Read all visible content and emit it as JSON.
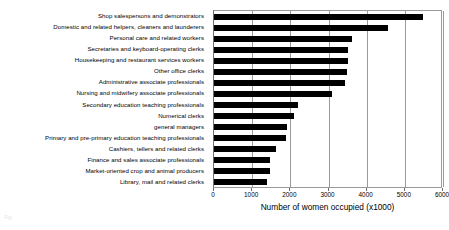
{
  "chart_data": {
    "type": "bar",
    "orientation": "horizontal",
    "title": "",
    "xlabel": "Number of women occupied (x1000)",
    "ylabel": "",
    "xlim": [
      0,
      6000
    ],
    "xticks": [
      0,
      1000,
      2000,
      3000,
      4000,
      5000,
      6000
    ],
    "xtick_labels": [
      "0",
      "1000",
      "2000",
      "3000",
      "4000",
      "5000",
      "6000"
    ],
    "grid": "vertical",
    "legend": "none",
    "bar_color": "#000000",
    "grid_color": "#9a9a9a",
    "categories": [
      "Shop salespersons and demonstrators",
      "Domestic and related helpers, cleaners and launderers",
      "Personal care and related workers",
      "Secretaries and keyboard-operating clerks",
      "Housekeeping and restaurant services workers",
      "Other office clerks",
      "Administrative associate professionals",
      "Nursing and midwifery associate professionals",
      "Secondary education teaching professionals",
      "Numerical clerks",
      "general managers",
      "Primary and pre-primary education teaching professionals",
      "Cashiers, tellers and related clerks",
      "Finance and sales associate professionals",
      "Market-oriented crop and animal producers",
      "Library, mail and related clerks"
    ],
    "values": [
      5470,
      4550,
      3610,
      3520,
      3520,
      3480,
      3440,
      3100,
      2210,
      2100,
      1900,
      1880,
      1630,
      1480,
      1470,
      1400
    ]
  },
  "caption": {
    "text": "Fig."
  }
}
